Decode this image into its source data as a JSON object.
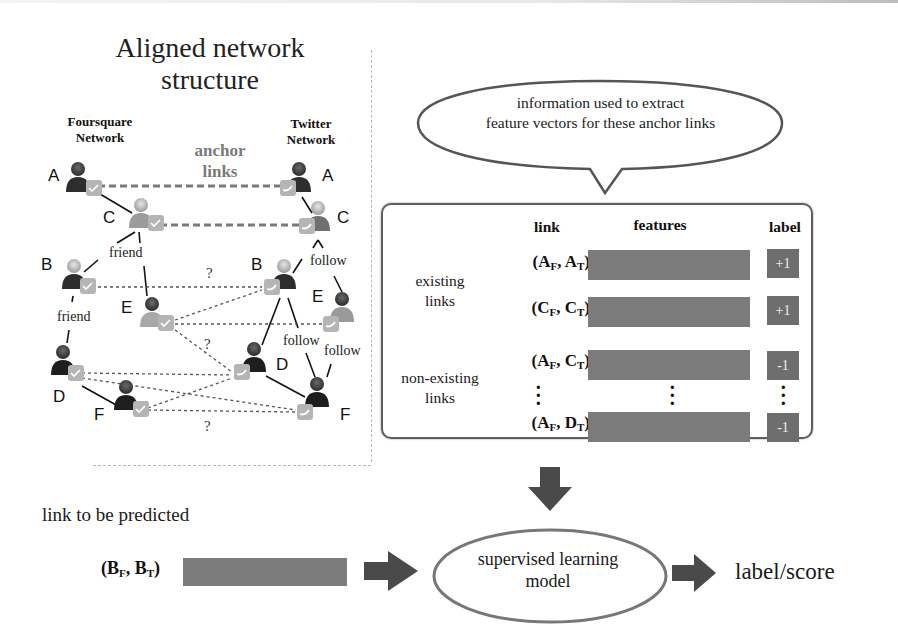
{
  "left_panel": {
    "title": "Aligned network structure",
    "title_lines": [
      "Aligned network",
      "structure"
    ],
    "foursquare_label_lines": [
      "Foursquare",
      "Network"
    ],
    "twitter_label_lines": [
      "Twitter",
      "Network"
    ],
    "anchor_label_lines": [
      "anchor",
      "links"
    ],
    "foursquare_nodes": [
      {
        "id": "A",
        "x": 78,
        "y": 163
      },
      {
        "id": "C",
        "x": 141,
        "y": 199
      },
      {
        "id": "B",
        "x": 70,
        "y": 260
      },
      {
        "id": "E",
        "x": 155,
        "y": 300
      },
      {
        "id": "D",
        "x": 62,
        "y": 346
      },
      {
        "id": "F",
        "x": 124,
        "y": 381
      }
    ],
    "twitter_nodes": [
      {
        "id": "A",
        "x": 300,
        "y": 165
      },
      {
        "id": "C",
        "x": 320,
        "y": 210
      },
      {
        "id": "B",
        "x": 282,
        "y": 270
      },
      {
        "id": "E",
        "x": 340,
        "y": 310
      },
      {
        "id": "D",
        "x": 254,
        "y": 355
      },
      {
        "id": "F",
        "x": 314,
        "y": 392
      }
    ],
    "edge_labels": {
      "friend_1": "friend",
      "friend_2": "friend",
      "follow_1": "follow",
      "follow_2": "follow",
      "follow_3": "follow",
      "unknown": "?"
    }
  },
  "bubble": {
    "text_lines": [
      "information used to extract",
      "feature vectors for these anchor links"
    ]
  },
  "feature_table": {
    "headers": {
      "link": "link",
      "features": "features",
      "label": "label"
    },
    "groups": {
      "existing": [
        "existing",
        "links"
      ],
      "non_existing": [
        "non-existing",
        "links"
      ]
    },
    "rows": [
      {
        "left": "A",
        "left_sub": "F",
        "right": "A",
        "right_sub": "T",
        "label": "+1"
      },
      {
        "left": "C",
        "left_sub": "F",
        "right": "C",
        "right_sub": "T",
        "label": "+1"
      },
      {
        "left": "A",
        "left_sub": "F",
        "right": "C",
        "right_sub": "T",
        "label": "-1"
      },
      {
        "left": "A",
        "left_sub": "F",
        "right": "D",
        "right_sub": "T",
        "label": "-1"
      }
    ],
    "ellipsis": "⋮"
  },
  "prediction": {
    "title": "link to be predicted",
    "link": {
      "left": "B",
      "left_sub": "F",
      "right": "B",
      "right_sub": "T"
    },
    "model_lines": [
      "supervised learning",
      "model"
    ],
    "output": "label/score"
  },
  "colors": {
    "bar": "#7b7b7b",
    "label_box": "#6e6e6e",
    "arrow": "#4a4a4a",
    "anchor_text": "#7a7a7a",
    "box_border": "#5e5e5e"
  }
}
